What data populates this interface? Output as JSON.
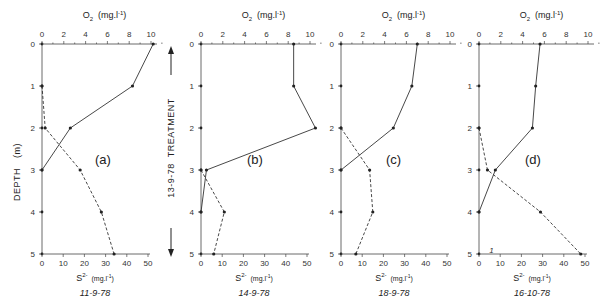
{
  "chart_data": {
    "type": "line",
    "figure": "Vertical profiles of dissolved oxygen and sulphide vs depth",
    "side_labels": {
      "ylabel": "DEPTH (m)",
      "treatment": "13-9-78  TREATMENT"
    },
    "panels": [
      {
        "tag": "(a)",
        "date": "11-9-78",
        "top_axis": {
          "label": "O2 (mg.l-1)",
          "ticks": [
            "0",
            "2",
            "4",
            "6",
            "8",
            "10"
          ],
          "range": [
            0,
            10
          ]
        },
        "bottom_axis": {
          "label": "S2- (mg.l-1)",
          "ticks": [
            "0",
            "10",
            "20",
            "30",
            "40",
            "50"
          ],
          "range": [
            0,
            50
          ]
        },
        "depth_ticks": [
          "0",
          "1",
          "2",
          "3",
          "4",
          "5"
        ],
        "series": [
          {
            "name": "O2",
            "style": "solid",
            "depth": [
              0,
              1,
              2,
              3
            ],
            "values": [
              10.2,
              8.3,
              2.6,
              0
            ]
          },
          {
            "name": "S2-",
            "style": "dashed",
            "depth": [
              1,
              2,
              3,
              4,
              5
            ],
            "values": [
              0,
              1.5,
              18,
              28,
              34
            ]
          }
        ]
      },
      {
        "tag": "(b)",
        "date": "14-9-78",
        "top_axis": {
          "label": "O2 (mg.l-1)",
          "ticks": [
            "0",
            "2",
            "4",
            "6",
            "8",
            "10"
          ],
          "range": [
            0,
            10
          ]
        },
        "bottom_axis": {
          "label": "S2- (mg.l-1)",
          "ticks": [
            "0",
            "10",
            "20",
            "30",
            "40",
            "50"
          ],
          "range": [
            0,
            50
          ]
        },
        "depth_ticks": [
          "0",
          "1",
          "2",
          "3",
          "4",
          "5"
        ],
        "series": [
          {
            "name": "O2",
            "style": "solid",
            "depth": [
              0,
              1,
              2,
              3,
              4
            ],
            "values": [
              8.5,
              8.5,
              10.5,
              0.5,
              0
            ]
          },
          {
            "name": "S2-",
            "style": "dashed",
            "depth": [
              3,
              4,
              5
            ],
            "values": [
              0,
              11,
              6
            ]
          }
        ]
      },
      {
        "tag": "(c)",
        "date": "18-9-78",
        "top_axis": {
          "label": "O2 (mg.l-1)",
          "ticks": [
            "0",
            "2",
            "4",
            "6",
            "8",
            "10"
          ],
          "range": [
            0,
            10
          ]
        },
        "bottom_axis": {
          "label": "S2- (mg.l-1)",
          "ticks": [
            "0",
            "10",
            "20",
            "30",
            "40",
            "50"
          ],
          "range": [
            0,
            50
          ]
        },
        "depth_ticks": [
          "0",
          "1",
          "2",
          "3",
          "4",
          "5"
        ],
        "series": [
          {
            "name": "O2",
            "style": "solid",
            "depth": [
              0,
              1,
              2,
              3
            ],
            "values": [
              7.0,
              6.5,
              4.8,
              0
            ]
          },
          {
            "name": "S2-",
            "style": "dashed",
            "depth": [
              2,
              3,
              4,
              5
            ],
            "values": [
              0,
              13.5,
              15,
              7
            ]
          }
        ]
      },
      {
        "tag": "(d)",
        "date": "16-10-78",
        "top_axis": {
          "label": "O2 (mg.l-1)",
          "ticks": [
            "0",
            "2",
            "4",
            "6",
            "8",
            "10"
          ],
          "range": [
            0,
            10
          ]
        },
        "bottom_axis": {
          "label": "S2- (mg.l-1)",
          "ticks": [
            "0",
            "10",
            "20",
            "30",
            "40",
            "50"
          ],
          "range": [
            0,
            50
          ]
        },
        "depth_ticks": [
          "0",
          "1",
          "2",
          "3",
          "4",
          "5"
        ],
        "annotation": "1",
        "series": [
          {
            "name": "O2",
            "style": "solid",
            "depth": [
              0,
              1,
              2,
              3,
              4
            ],
            "values": [
              5.6,
              5.2,
              4.9,
              1.5,
              0
            ]
          },
          {
            "name": "S2-",
            "style": "dashed",
            "depth": [
              2,
              3,
              4,
              5
            ],
            "values": [
              0,
              4,
              29,
              48
            ]
          }
        ]
      }
    ],
    "grid": false,
    "legend": "none"
  },
  "labels": {
    "o2_main": "O",
    "o2_sub": "2",
    "o2_units": "(mg.l",
    "o2_sup": "-1",
    "o2_close": ")",
    "s_main": "S",
    "s_sup": "2-",
    "s_units": "(mg.l",
    "s_sup2": "-1",
    "s_close": ")",
    "depth": "DEPTH",
    "depth_unit": "(m)",
    "treatment_date": "13-9-78",
    "treatment": "TREATMENT"
  }
}
